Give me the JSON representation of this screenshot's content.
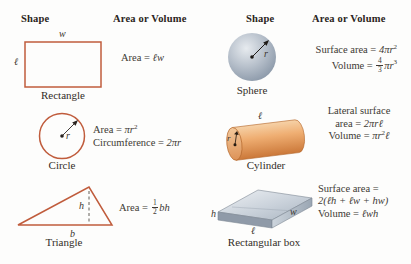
{
  "palette": {
    "shape_outline": "#c05c3c",
    "text": "#403a34",
    "header_text": "#2a2420",
    "sphere_fill": "#b7c0cb",
    "cylinder_fill": "#eda96b",
    "box_fill": "#c3ccd5"
  },
  "headers": {
    "left_shape": "Shape",
    "left_area": "Area or Volume",
    "right_shape": "Shape",
    "right_area": "Area or Volume"
  },
  "rectangle": {
    "caption": "Rectangle",
    "width_label": "w",
    "length_label": "ℓ",
    "area_prefix": "Area = ",
    "area_math": "ℓw"
  },
  "circle": {
    "caption": "Circle",
    "radius_label": "r",
    "area_prefix": "Area = ",
    "area_math": "πr",
    "area_exp": "2",
    "circumference_prefix": "Circumference = ",
    "circumference_math": "2πr"
  },
  "triangle": {
    "caption": "Triangle",
    "height_label": "h",
    "base_label": "b",
    "area_prefix": "Area = ",
    "frac_num": "1",
    "frac_den": "2",
    "area_math": "bh"
  },
  "sphere": {
    "caption": "Sphere",
    "radius_label": "r",
    "surface_prefix": "Surface area = ",
    "surface_math": "4πr",
    "surface_exp": "2",
    "volume_prefix": "Volume = ",
    "volume_frac_num": "4",
    "volume_frac_den": "3",
    "volume_math": "πr",
    "volume_exp": "3"
  },
  "cylinder": {
    "caption": "Cylinder",
    "length_label": "ℓ",
    "radius_label": "r",
    "lateral_line1": "Lateral surface",
    "lateral_prefix": "area = ",
    "lateral_math": "2πrℓ",
    "volume_prefix": "Volume = ",
    "volume_math": "πr",
    "volume_exp": "2",
    "volume_tail": "ℓ"
  },
  "box": {
    "caption": "Rectangular box",
    "height_label": "h",
    "width_label": "w",
    "length_label": "ℓ",
    "surface_line1": "Surface area =",
    "surface_line2": "2(ℓh + ℓw + hw)",
    "volume_prefix": "Volume = ",
    "volume_math": "ℓwh"
  }
}
